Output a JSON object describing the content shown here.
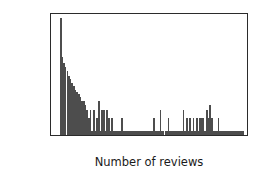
{
  "chart_data": {
    "type": "bar",
    "title": "",
    "xlabel": "Number of reviews",
    "ylabel": "Number of apps",
    "xlim": [
      -400,
      8450
    ],
    "ylim": [
      0.8,
      520
    ],
    "yscale": "log",
    "grid": false,
    "legend": null,
    "bar_color": "#4d4d4d",
    "bin_width": 75,
    "xticks": [
      0,
      2000,
      4000,
      6000,
      8000
    ],
    "xtick_labels": [
      "0",
      "2000",
      "4000",
      "6000",
      "8000"
    ],
    "yticks": [
      1,
      10,
      100
    ],
    "ytick_labels": [
      "10⁰",
      "10¹",
      "10²"
    ],
    "ytick_bases": [
      "10",
      "10",
      "10"
    ],
    "ytick_exponents": [
      "0",
      "1",
      "2"
    ],
    "x": [
      0,
      75,
      150,
      225,
      300,
      375,
      450,
      525,
      600,
      675,
      750,
      825,
      900,
      975,
      1050,
      1125,
      1200,
      1275,
      1350,
      1425,
      1500,
      1575,
      1650,
      1725,
      1800,
      1875,
      1950,
      2025,
      2100,
      2175,
      2250,
      2325,
      2400,
      2475,
      2550,
      2625,
      2700,
      2775,
      2850,
      2925,
      3000,
      3075,
      3150,
      3225,
      3300,
      3375,
      3450,
      3525,
      3600,
      3675,
      3750,
      3825,
      3900,
      3975,
      4050,
      4125,
      4200,
      4275,
      4350,
      4425,
      4500,
      4575,
      4650,
      4725,
      4800,
      4875,
      4950,
      5025,
      5100,
      5175,
      5250,
      5325,
      5400,
      5475,
      5550,
      5625,
      5700,
      5775,
      5850,
      5925,
      6000,
      6075,
      6150,
      6225,
      6300,
      6375,
      6450,
      6525,
      6600,
      6675,
      6750,
      6825,
      6900,
      6975,
      7050,
      7125,
      7200,
      7275,
      7350,
      7425,
      7500,
      7575,
      7650,
      7725,
      7800,
      7875,
      7950,
      8025,
      8100,
      8175,
      8250
    ],
    "values": [
      420,
      52,
      38,
      30,
      24,
      19,
      16,
      13,
      11,
      9,
      8,
      7,
      6,
      5,
      5,
      4,
      3,
      2,
      3,
      1,
      3,
      1,
      2,
      5,
      1,
      3,
      3,
      1,
      3,
      2,
      1,
      2,
      1,
      1,
      1,
      1,
      1,
      2,
      1,
      1,
      1,
      1,
      1,
      1,
      1,
      1,
      1,
      1,
      1,
      1,
      1,
      1,
      1,
      1,
      1,
      1,
      2,
      1,
      1,
      1,
      3,
      1,
      1,
      1,
      1,
      2,
      1,
      1,
      1,
      1,
      1,
      1,
      1,
      1,
      3,
      1,
      2,
      1,
      2,
      1,
      2,
      1,
      2,
      1,
      2,
      2,
      2,
      1,
      3,
      2,
      4,
      2,
      1,
      1,
      1,
      2,
      1,
      1,
      1,
      1,
      1,
      1,
      1,
      1,
      1,
      1,
      1,
      1,
      1,
      1,
      1
    ]
  },
  "figure": {
    "background": "#ffffff",
    "axis_color": "#2b2b2b",
    "text_color": "#1a1a1a"
  }
}
